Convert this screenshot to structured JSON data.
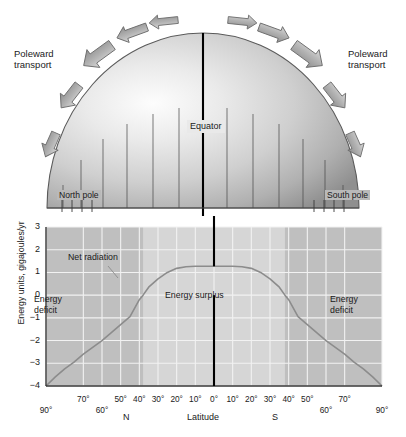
{
  "figure": {
    "ghost_top_text": "      "
  },
  "globe": {
    "equator_label": "Equator",
    "north_pole_label": "North pole",
    "south_pole_label": "South pole",
    "poleward_left": "Poleward\ntransport",
    "poleward_right": "Poleward\ntransport",
    "arrow_count": 10,
    "meridian_count": 13
  },
  "chart_data": {
    "type": "line",
    "title": "",
    "xlabel": "Latitude",
    "ylabel": "Energy units, gigajoules/yr",
    "ylim": [
      -4,
      3
    ],
    "xlim": [
      -90,
      90
    ],
    "grid": true,
    "yticks": [
      3,
      2,
      1,
      0,
      -1,
      -2,
      -3,
      -4
    ],
    "ytick_labels": [
      "3",
      "2",
      "1",
      "0",
      "−1",
      "−2",
      "−3",
      "−4"
    ],
    "xticks": [
      -90,
      -70,
      -60,
      -50,
      -40,
      -30,
      -20,
      -10,
      0,
      10,
      20,
      30,
      40,
      50,
      60,
      70,
      90
    ],
    "xtick_labels": [
      "90°",
      "70°",
      "60°",
      "50°",
      "40°",
      "30°",
      "20°",
      "10°",
      "0°",
      "10°",
      "20°",
      "30°",
      "40°",
      "50°",
      "60°",
      "70°",
      "90°"
    ],
    "hemisphere_left_label": "N",
    "hemisphere_right_label": "S",
    "series": [
      {
        "name": "Net radiation",
        "x": [
          -90,
          -85,
          -80,
          -75,
          -70,
          -65,
          -60,
          -55,
          -50,
          -45,
          -40,
          -38,
          -35,
          -30,
          -25,
          -20,
          -15,
          -10,
          -5,
          0,
          5,
          10,
          15,
          20,
          25,
          30,
          35,
          38,
          40,
          45,
          50,
          55,
          60,
          65,
          70,
          75,
          80,
          85,
          90
        ],
        "y": [
          -4.0,
          -3.6,
          -3.25,
          -2.95,
          -2.6,
          -2.3,
          -2.0,
          -1.65,
          -1.3,
          -0.95,
          -0.2,
          0.0,
          0.35,
          0.72,
          1.0,
          1.18,
          1.25,
          1.27,
          1.27,
          1.27,
          1.27,
          1.27,
          1.25,
          1.18,
          1.0,
          0.72,
          0.35,
          0.0,
          -0.2,
          -0.95,
          -1.3,
          -1.65,
          -2.0,
          -2.3,
          -2.6,
          -2.95,
          -3.25,
          -3.6,
          -4.0
        ]
      }
    ],
    "annotations": [
      {
        "name": "net-radiation",
        "text": "Net radiation"
      },
      {
        "name": "energy-surplus",
        "text": "Energy surplus"
      },
      {
        "name": "energy-deficit-left",
        "text": "Energy\ndeficit"
      },
      {
        "name": "energy-deficit-right",
        "text": "Energy\ndeficit"
      }
    ],
    "zero_crossings": [
      -38,
      38
    ],
    "plateau_value": 1.27,
    "deficit_regions": [
      [
        -90,
        -38
      ],
      [
        38,
        90
      ]
    ]
  },
  "colors": {
    "plot_background": "#d6d6d6",
    "deficit_fill": "#bfbfbf",
    "gridline": "#f2f2f2",
    "curve": "#8c8c8c",
    "axis": "#3a3a3a",
    "equator_line": "#000000",
    "text": "#1b1b1b"
  }
}
